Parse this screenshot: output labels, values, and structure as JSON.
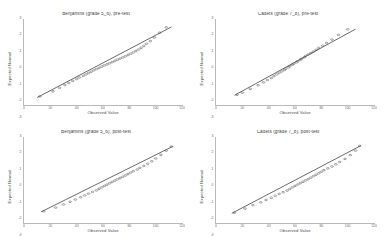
{
  "figure": {
    "layout": "2x2-grid",
    "background_color": "#ffffff",
    "line_color": "#2b2b2b",
    "point_color": "#4f4f4f",
    "axis_color": "#b9b9b9",
    "text_color": "#4a4a4a"
  },
  "chart_data": [
    {
      "type": "scatter",
      "title": "Benjamins (grade 5_6), pre-test",
      "xlabel": "Observed Value",
      "ylabel": "Expected Normal",
      "xlim": [
        0,
        120
      ],
      "ylim": [
        -3,
        3
      ],
      "xticks": [
        "0",
        "20",
        "40",
        "60",
        "80",
        "100",
        "120"
      ],
      "yticks": [
        "-3",
        "-2",
        "-1",
        "0",
        "1",
        "2",
        "3"
      ],
      "grid": false,
      "reference_line": {
        "x": [
          10,
          112
        ],
        "y": [
          -2.45,
          2.45
        ]
      },
      "x": [
        12,
        22,
        27,
        31,
        34,
        37,
        40,
        42,
        45,
        47,
        49,
        51,
        53,
        55,
        57,
        59,
        61,
        63,
        65,
        67,
        69,
        71,
        73,
        75,
        77,
        79,
        81,
        83,
        85,
        87,
        89,
        91,
        93,
        96,
        99,
        103,
        108
      ],
      "y": [
        -2.38,
        -2.02,
        -1.78,
        -1.58,
        -1.44,
        -1.3,
        -1.17,
        -1.06,
        -0.95,
        -0.85,
        -0.75,
        -0.66,
        -0.57,
        -0.48,
        -0.4,
        -0.31,
        -0.23,
        -0.15,
        -0.07,
        0.01,
        0.09,
        0.17,
        0.25,
        0.33,
        0.41,
        0.5,
        0.59,
        0.68,
        0.78,
        0.88,
        1.0,
        1.13,
        1.28,
        1.47,
        1.72,
        2.05,
        2.42
      ]
    },
    {
      "type": "scatter",
      "title": "Cadets (grade 7_8), pre-test",
      "xlabel": "Observed Value",
      "ylabel": "Expected Normal",
      "xlim": [
        0,
        120
      ],
      "ylim": [
        -3,
        3
      ],
      "xticks": [
        "0",
        "20",
        "40",
        "60",
        "80",
        "100",
        "120"
      ],
      "yticks": [
        "-3",
        "-2",
        "-1",
        "0",
        "1",
        "2",
        "3"
      ],
      "grid": false,
      "reference_line": {
        "x": [
          14,
          106
        ],
        "y": [
          -2.3,
          2.3
        ]
      },
      "x": [
        16,
        20,
        26,
        32,
        36,
        39,
        42,
        44,
        46,
        48,
        50,
        52,
        53,
        55,
        56,
        58,
        59,
        61,
        62,
        64,
        65,
        67,
        68,
        70,
        72,
        74,
        76,
        78,
        81,
        84,
        88,
        93,
        100
      ],
      "y": [
        -2.26,
        -2.12,
        -1.85,
        -1.6,
        -1.4,
        -1.24,
        -1.1,
        -0.97,
        -0.85,
        -0.74,
        -0.64,
        -0.54,
        -0.45,
        -0.36,
        -0.27,
        -0.18,
        -0.1,
        -0.01,
        0.07,
        0.16,
        0.25,
        0.34,
        0.43,
        0.53,
        0.63,
        0.74,
        0.86,
        0.99,
        1.15,
        1.33,
        1.57,
        1.9,
        2.28
      ]
    },
    {
      "type": "scatter",
      "title": "Benjamins (grade 5_6), post-test",
      "xlabel": "Observed Value",
      "ylabel": "Expected Normal",
      "xlim": [
        0,
        120
      ],
      "ylim": [
        -3,
        3
      ],
      "xticks": [
        "0",
        "20",
        "40",
        "60",
        "80",
        "100",
        "120"
      ],
      "yticks": [
        "-3",
        "-2",
        "-1",
        "0",
        "1",
        "2",
        "3"
      ],
      "grid": false,
      "reference_line": {
        "x": [
          13,
          113
        ],
        "y": [
          -2.2,
          2.35
        ]
      },
      "x": [
        15,
        24,
        30,
        35,
        39,
        43,
        46,
        49,
        52,
        55,
        57,
        59,
        61,
        63,
        65,
        67,
        69,
        71,
        73,
        75,
        77,
        79,
        81,
        83,
        86,
        88,
        91,
        94,
        97,
        100,
        104,
        108,
        112
      ],
      "y": [
        -2.16,
        -1.9,
        -1.68,
        -1.5,
        -1.34,
        -1.19,
        -1.06,
        -0.93,
        -0.82,
        -0.71,
        -0.6,
        -0.5,
        -0.4,
        -0.31,
        -0.21,
        -0.12,
        -0.03,
        0.06,
        0.15,
        0.24,
        0.33,
        0.43,
        0.53,
        0.63,
        0.74,
        0.86,
        0.99,
        1.14,
        1.31,
        1.51,
        1.76,
        2.05,
        2.33
      ]
    },
    {
      "type": "scatter",
      "title": "Cadets (grade 7_8), post-test",
      "xlabel": "Observed Value",
      "ylabel": "Expected Normal",
      "xlim": [
        0,
        120
      ],
      "ylim": [
        -3,
        3
      ],
      "xticks": [
        "0",
        "20",
        "40",
        "60",
        "80",
        "100",
        "120"
      ],
      "yticks": [
        "-3",
        "-2",
        "-1",
        "0",
        "1",
        "2",
        "3"
      ],
      "grid": false,
      "reference_line": {
        "x": [
          12,
          110
        ],
        "y": [
          -2.3,
          2.4
        ]
      },
      "x": [
        14,
        22,
        28,
        34,
        38,
        42,
        45,
        48,
        51,
        54,
        56,
        58,
        60,
        62,
        64,
        66,
        68,
        70,
        72,
        74,
        76,
        78,
        80,
        82,
        85,
        88,
        91,
        94,
        98,
        102,
        106,
        109
      ],
      "y": [
        -2.26,
        -1.97,
        -1.73,
        -1.54,
        -1.37,
        -1.22,
        -1.08,
        -0.95,
        -0.83,
        -0.72,
        -0.61,
        -0.5,
        -0.4,
        -0.3,
        -0.2,
        -0.11,
        -0.01,
        0.08,
        0.18,
        0.28,
        0.38,
        0.48,
        0.59,
        0.7,
        0.82,
        0.95,
        1.1,
        1.27,
        1.48,
        1.74,
        2.06,
        2.38
      ]
    }
  ]
}
